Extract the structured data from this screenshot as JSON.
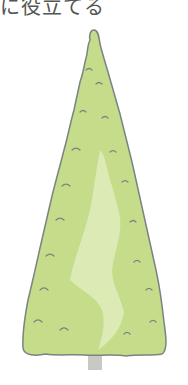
{
  "caption": {
    "text": "に役立てる"
  },
  "illustration": {
    "subject": "conifer-tree",
    "colors": {
      "foliage": "#c5dd8a",
      "highlight": "#dcebb5",
      "outline": "#7a8480",
      "trunk": "#c8c8c4"
    }
  }
}
